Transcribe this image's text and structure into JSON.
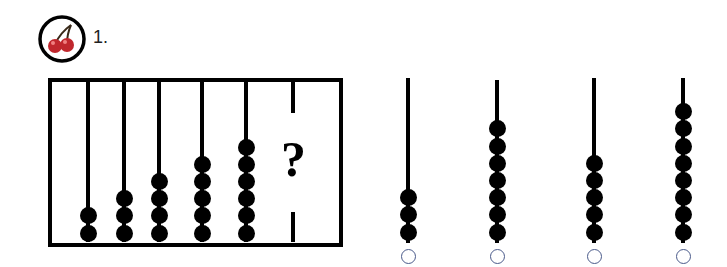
{
  "question": {
    "number_label": "1.",
    "badge_icon": "cherry-icon",
    "abacus_bead_counts": [
      2,
      3,
      4,
      5,
      6
    ],
    "missing_marker": "?"
  },
  "options": [
    {
      "beads": 3
    },
    {
      "beads": 7
    },
    {
      "beads": 5
    },
    {
      "beads": 8
    }
  ],
  "colors": {
    "bead": "#000000",
    "cherry": "#c0272d",
    "radio_border": "#4a5a8a"
  }
}
